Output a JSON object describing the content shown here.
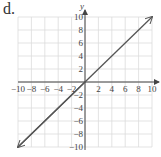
{
  "panel_label": "d.",
  "chart_data": {
    "type": "line",
    "title": "",
    "xlabel": "",
    "ylabel": "y",
    "xlim": [
      -10,
      10
    ],
    "ylim": [
      -10,
      10
    ],
    "grid": true,
    "x_ticks": [
      -10,
      -8,
      -6,
      -4,
      -2,
      2,
      4,
      6,
      8,
      10
    ],
    "y_ticks": [
      10,
      8,
      6,
      4,
      2,
      -2,
      -4,
      -6,
      -8,
      -10
    ],
    "series": [
      {
        "name": "y = x",
        "x": [
          -10,
          10
        ],
        "y": [
          -10,
          10
        ],
        "arrows": "both",
        "color": "#555555"
      }
    ]
  }
}
